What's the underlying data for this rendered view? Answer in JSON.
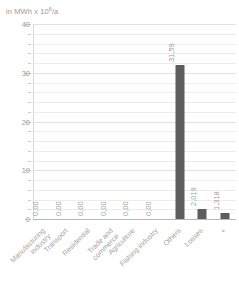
{
  "chart_data": {
    "type": "bar",
    "title": "",
    "axis_unit_caption": "in MWh x 10⁶/a",
    "ylabel": "",
    "xlabel": "",
    "ylim": [
      0,
      40
    ],
    "y_ticks": [
      0,
      10,
      20,
      30,
      40
    ],
    "y_tick_labels": [
      "0",
      "10",
      "20",
      "30",
      "40"
    ],
    "y_minor_step": 2,
    "grid": true,
    "legend": "none",
    "categories": [
      "Manufacturing\nindustry",
      "Transport",
      "Residential",
      "Trade and\ncommerce",
      "Agriculture",
      "Fishing industry",
      "Others",
      "Losses",
      "+"
    ],
    "values": [
      0.0,
      0.0,
      0.0,
      0.0,
      0.0,
      0.0,
      31.59,
      2.019,
      1.318
    ],
    "value_labels": [
      "0,00",
      "0,00",
      "0,00",
      "0,00",
      "0,00",
      "0,00",
      "31,59",
      "2,019",
      "1,318"
    ],
    "bar_color": "#5d5d5d",
    "grid_color": "#ececec",
    "text_color": "#a0a0a0"
  }
}
